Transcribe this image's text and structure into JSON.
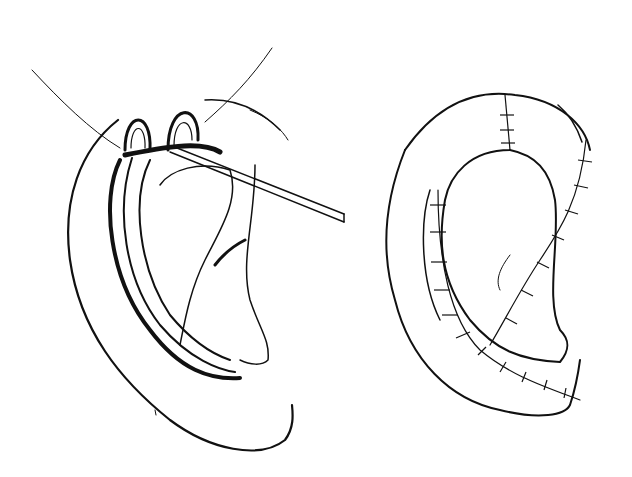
{
  "figure": {
    "background": "#ffffff",
    "ink": "#111111",
    "panels": [
      {
        "id": "left",
        "content": "ear with retracted helical flap held by hooks and a probe"
      },
      {
        "id": "right",
        "content": "ear after closure showing sutured incision lines"
      }
    ]
  }
}
